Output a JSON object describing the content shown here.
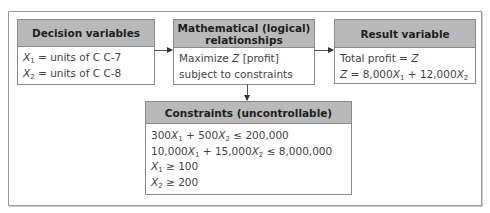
{
  "diagram": {
    "decision": {
      "title": "Decision variables",
      "lines": [
        {
          "var": "X",
          "sub": "1",
          "rest": " = units of C C-7"
        },
        {
          "var": "X",
          "sub": "2",
          "rest": " = units of C C-8"
        }
      ]
    },
    "math": {
      "title_line1": "Mathematical (logical)",
      "title_line2": "relationships",
      "line1_pre": "Maximize ",
      "line1_var": "Z",
      "line1_post": " [profit]",
      "line2": "subject to constraints"
    },
    "result": {
      "title": "Result variable",
      "line1_pre": "Total profit = ",
      "line1_var": "Z",
      "line2": {
        "z": "Z",
        "eq": " = 8,000",
        "x1": "X",
        "x1_sub": "1",
        "plus": " + 12,000",
        "x2": "X",
        "x2_sub": "2"
      }
    },
    "constraints": {
      "title": "Constraints (uncontrollable)",
      "c1": {
        "a": "300",
        "x1": "X",
        "s1": "1",
        "b": " + 500",
        "x2": "X",
        "s2": "2",
        "rhs": " ≤ 200,000"
      },
      "c2": {
        "a": "10,000",
        "x1": "X",
        "s1": "1",
        "b": " + 15,000",
        "x2": "X",
        "s2": "2",
        "rhs": " ≤ 8,000,000"
      },
      "c3": {
        "x": "X",
        "s": "1",
        "rhs": " ≥ 100"
      },
      "c4": {
        "x": "X",
        "s": "2",
        "rhs": " ≥ 200"
      }
    },
    "colors": {
      "header_fill": "#b9b9b9",
      "border": "#8a8a8a",
      "text": "#444444"
    }
  }
}
